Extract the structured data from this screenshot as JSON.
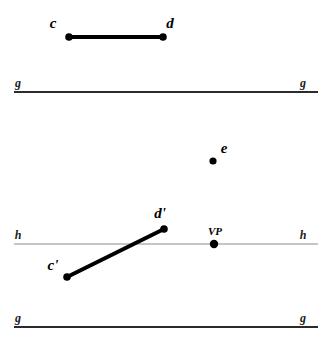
{
  "figure": {
    "width": 330,
    "height": 345,
    "background_color": "#ffffff",
    "ink_color": "#000000",
    "horizon_color": "#8c8c8c",
    "ground_color": "#2b2b2b"
  },
  "reference_lines": [
    {
      "id": "ground-top",
      "name": "g",
      "left_label": "g",
      "right_label": "g",
      "x1": 14,
      "x2": 318,
      "y": 92,
      "stroke": "#2b2b2b",
      "width": 1.8,
      "left_label_x": 18,
      "right_label_x": 303,
      "label_y": 87
    },
    {
      "id": "horizon",
      "name": "h",
      "left_label": "h",
      "right_label": "h",
      "x1": 14,
      "x2": 318,
      "y": 244,
      "stroke": "#8c8c8c",
      "width": 1.1,
      "left_label_x": 18,
      "right_label_x": 303,
      "label_y": 239
    },
    {
      "id": "ground-bottom",
      "name": "g",
      "left_label": "g",
      "right_label": "g",
      "x1": 14,
      "x2": 318,
      "y": 327,
      "stroke": "#2b2b2b",
      "width": 1.8,
      "left_label_x": 18,
      "right_label_x": 303,
      "label_y": 322
    }
  ],
  "segments": [
    {
      "id": "segment-cd",
      "label": "cd",
      "x1": 69,
      "y1": 37,
      "x2": 163,
      "y2": 37,
      "stroke": "#000000",
      "width": 4
    },
    {
      "id": "segment-cprime-dprime",
      "label": "c'd'",
      "x1": 67,
      "y1": 277,
      "x2": 164,
      "y2": 229,
      "stroke": "#000000",
      "width": 4
    }
  ],
  "points": [
    {
      "id": "point-c",
      "label": "c",
      "x": 69,
      "y": 37,
      "r": 3.8,
      "label_x": 53,
      "label_y": 28,
      "anchor": "middle"
    },
    {
      "id": "point-d",
      "label": "d",
      "x": 163,
      "y": 37,
      "r": 3.8,
      "label_x": 170,
      "label_y": 28,
      "anchor": "middle"
    },
    {
      "id": "point-e",
      "label": "e",
      "x": 213,
      "y": 161,
      "r": 3.6,
      "label_x": 224,
      "label_y": 153,
      "anchor": "middle"
    },
    {
      "id": "point-d-prime",
      "label": "d'",
      "x": 164,
      "y": 229,
      "r": 3.8,
      "label_x": 160,
      "label_y": 218,
      "anchor": "middle"
    },
    {
      "id": "point-c-prime",
      "label": "c'",
      "x": 67,
      "y": 277,
      "r": 3.8,
      "label_x": 53,
      "label_y": 270,
      "anchor": "middle"
    }
  ],
  "vanishing_point": {
    "id": "point-vp",
    "label": "VP",
    "x": 214,
    "y": 244,
    "r": 4.2,
    "label_x": 215,
    "label_y": 235,
    "anchor": "middle"
  }
}
